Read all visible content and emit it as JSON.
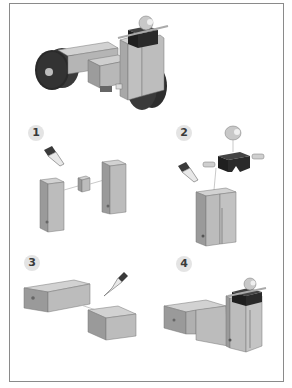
{
  "diagram": {
    "type": "assembly-instructions",
    "hero": {
      "label": "assembled-vehicle"
    },
    "steps": [
      {
        "number": "1",
        "parts": [
          "tall-block-left",
          "small-connector",
          "tall-block-right"
        ],
        "tool": "glue"
      },
      {
        "number": "2",
        "parts": [
          "ball",
          "black-bracket",
          "axle-pin-left",
          "axle-pin-right",
          "joined-tall-blocks"
        ],
        "tool": "glue"
      },
      {
        "number": "3",
        "parts": [
          "flat-block-large",
          "flat-block-small"
        ],
        "tool": "glue"
      },
      {
        "number": "4",
        "parts": [
          "flat-blocks-joined",
          "tower-with-bracket"
        ],
        "tool": null
      }
    ]
  },
  "colors": {
    "frame": "#8a8a8a",
    "wood_front": "#b9b9b9",
    "wood_side": "#9a9a9a",
    "wood_top": "#d2d2d2",
    "wheel": "#2e2e2e",
    "bracket": "#1f1f1f",
    "badge_bg": "#e4e4e4"
  }
}
